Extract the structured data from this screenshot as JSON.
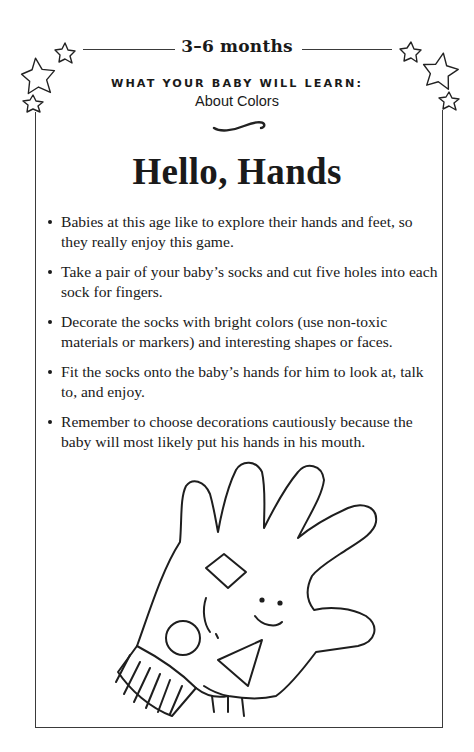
{
  "header": {
    "age_range": "3–6 months",
    "learn_label": "WHAT YOUR BABY WILL LEARN:",
    "learn_topic": "About Colors"
  },
  "activity": {
    "title": "Hello, Hands",
    "steps": [
      "Babies at this age like to explore their hands and feet, so they really enjoy this game.",
      "Take a pair of your baby’s socks and cut five holes into each sock for fingers.",
      "Decorate the socks with bright colors (use non-toxic materials or markers) and interesting shapes or faces.",
      "Fit the socks onto the baby’s hands for him to look at, talk to, and enjoy.",
      "Remember to choose decorations cautiously because the baby will most likely put his hands in his mouth."
    ]
  },
  "illustration": {
    "subject": "sock-puppet hand with diamond, circle, triangle and smiley face",
    "decorations": [
      "star-cluster-left",
      "star-cluster-right",
      "swash-divider"
    ]
  },
  "colors": {
    "ink": "#1a1a1a",
    "rule": "#3a3a3a",
    "background": "#ffffff"
  }
}
